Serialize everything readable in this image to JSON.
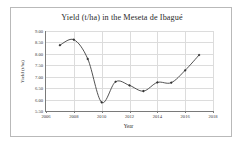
{
  "chart_data": {
    "type": "line",
    "title": "Yield (t/ha) in the Meseta de Ibagué",
    "xlabel": "Year",
    "ylabel": "Yield (t/ha)",
    "xlim": [
      2006,
      2018
    ],
    "ylim": [
      5.5,
      9.0
    ],
    "grid": true,
    "legend": "none",
    "marker": "filled-diamond",
    "line_color": "#404040",
    "marker_color": "#333333",
    "x_ticks": [
      2006,
      2008,
      2010,
      2012,
      2014,
      2016,
      2018
    ],
    "x_tick_labels": [
      "2006",
      "2008",
      "2010",
      "2012",
      "2014",
      "2016",
      "2018"
    ],
    "y_ticks": [
      5.5,
      6.0,
      6.5,
      7.0,
      7.5,
      8.0,
      8.5,
      9.0
    ],
    "y_tick_labels": [
      "5.50",
      "6.00",
      "6.50",
      "7.00",
      "7.50",
      "8.00",
      "8.50",
      "9.00"
    ],
    "x": [
      2007,
      2008,
      2009,
      2010,
      2011,
      2012,
      2013,
      2014,
      2015,
      2016,
      2017
    ],
    "values": [
      8.38,
      8.62,
      7.78,
      5.88,
      6.78,
      6.62,
      6.37,
      6.75,
      6.74,
      7.28,
      7.95
    ],
    "series": [
      {
        "name": "Yield",
        "values": [
          8.38,
          8.62,
          7.78,
          5.88,
          6.78,
          6.62,
          6.37,
          6.75,
          6.74,
          7.28,
          7.95
        ]
      }
    ]
  }
}
